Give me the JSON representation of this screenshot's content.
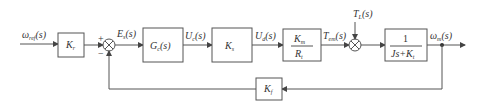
{
  "diagram": {
    "input": {
      "symbol": "ω",
      "sub": "ref",
      "arg": "(s)"
    },
    "blocks": {
      "kr": {
        "sym": "K",
        "sub": "r"
      },
      "gc": {
        "sym": "G",
        "sub": "c",
        "arg": "(s)"
      },
      "ks": {
        "sym": "K",
        "sub": "s"
      },
      "kmrt": {
        "num_sym": "K",
        "num_sub": "m",
        "den_sym": "R",
        "den_sub": "t"
      },
      "plant": {
        "num": "1",
        "den_a": "Js+K",
        "den_sub": "t"
      },
      "kf": {
        "sym": "K",
        "sub": "f"
      }
    },
    "signals": {
      "es": {
        "sym": "E",
        "sub": "s",
        "arg": "(s)"
      },
      "uc": {
        "sym": "U",
        "sub": "c",
        "arg": "(s)"
      },
      "ud": {
        "sym": "U",
        "sub": "d",
        "arg": "(s)"
      },
      "tem": {
        "sym": "T",
        "sub": "em",
        "arg": "(s)"
      },
      "tl": {
        "sym": "T",
        "sub": "L",
        "arg": "(s)"
      },
      "wm": {
        "sym": "ω",
        "sub": "m",
        "arg": "(s)"
      }
    },
    "summing": {
      "plus": "+",
      "minus": "−"
    }
  }
}
